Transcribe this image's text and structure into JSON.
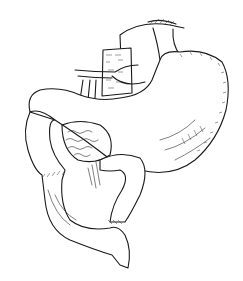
{
  "image": {
    "description": "Black-and-white anatomical line illustration of the stomach with esophagus, duodenum and jejunal loops (gastrojejunostomy)",
    "colors": {
      "ink": "#1a1a1a",
      "background": "#ffffff"
    },
    "parts": [
      "esophagus",
      "stomach",
      "vessels",
      "omentum",
      "duodenum",
      "jejunum"
    ]
  }
}
